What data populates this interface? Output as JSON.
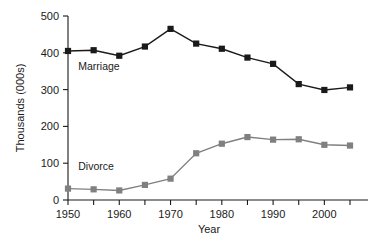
{
  "chart_data": {
    "type": "line",
    "title": "",
    "xlabel": "Year",
    "ylabel": "Thousands (000s)",
    "x": [
      1950,
      1955,
      1960,
      1965,
      1970,
      1975,
      1980,
      1985,
      1990,
      1995,
      2000,
      2005
    ],
    "xlim": [
      1950,
      2005
    ],
    "ylim": [
      0,
      500
    ],
    "x_ticks": [
      1950,
      1955,
      1960,
      1965,
      1970,
      1975,
      1980,
      1985,
      1990,
      1995,
      2000,
      2005
    ],
    "x_tick_labels": [
      "1950",
      "",
      "1960",
      "",
      "1970",
      "",
      "1980",
      "",
      "1990",
      "",
      "2000",
      ""
    ],
    "y_ticks": [
      0,
      100,
      200,
      300,
      400,
      500
    ],
    "y_tick_labels": [
      "0",
      "100",
      "200",
      "300",
      "400",
      "500"
    ],
    "grid": false,
    "legend_position": "inline-annotation",
    "series": [
      {
        "name": "Marriage",
        "color": "#1a1a1a",
        "marker": "square",
        "values": [
          405,
          407,
          392,
          417,
          465,
          425,
          411,
          387,
          370,
          315,
          299,
          306
        ]
      },
      {
        "name": "Divorce",
        "color": "#808080",
        "marker": "square",
        "values": [
          31,
          29,
          26,
          41,
          58,
          127,
          153,
          171,
          164,
          165,
          150,
          148
        ]
      }
    ],
    "annotations": [
      {
        "text": "Marriage",
        "x": 1952,
        "y": 352
      },
      {
        "text": "Divorce",
        "x": 1952,
        "y": 82
      }
    ]
  },
  "colors": {
    "marriage": "#1a1a1a",
    "divorce": "#808080",
    "axis": "#1a1a1a",
    "background": "#ffffff"
  }
}
